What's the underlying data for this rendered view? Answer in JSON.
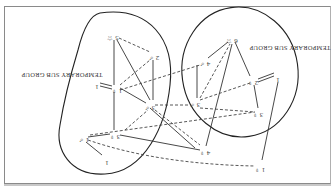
{
  "diagram": {
    "orientation": "rotated-180",
    "groups": [
      {
        "id": "g-left",
        "label": "TEMPORARY SUB GROUP"
      },
      {
        "id": "g-right",
        "label": "TEMPORARY SUB GROUP"
      }
    ],
    "nodes": [
      {
        "id": "n1",
        "label": "5 ☆"
      },
      {
        "id": "n2",
        "label": "2 ♂"
      },
      {
        "id": "n3",
        "label": "1 ♀"
      },
      {
        "id": "n4",
        "label": "1"
      },
      {
        "id": "n5",
        "label": "3 ♂"
      },
      {
        "id": "n6",
        "label": "3 ♂"
      },
      {
        "id": "n7",
        "label": "4 ♂"
      },
      {
        "id": "n8",
        "label": "6 ☆"
      },
      {
        "id": "n9",
        "label": "2 ♀"
      },
      {
        "id": "n10",
        "label": "1"
      },
      {
        "id": "n11",
        "label": "3 ♀"
      },
      {
        "id": "n12",
        "label": "3 ♀"
      },
      {
        "id": "n13",
        "label": "1 ♂"
      },
      {
        "id": "n14",
        "label": "1"
      },
      {
        "id": "n15",
        "label": "4 ♀"
      },
      {
        "id": "n16",
        "label": "1 ♀"
      }
    ],
    "legend_note": "solid line = attraction, dashed line = rejection, double line = mutual"
  }
}
